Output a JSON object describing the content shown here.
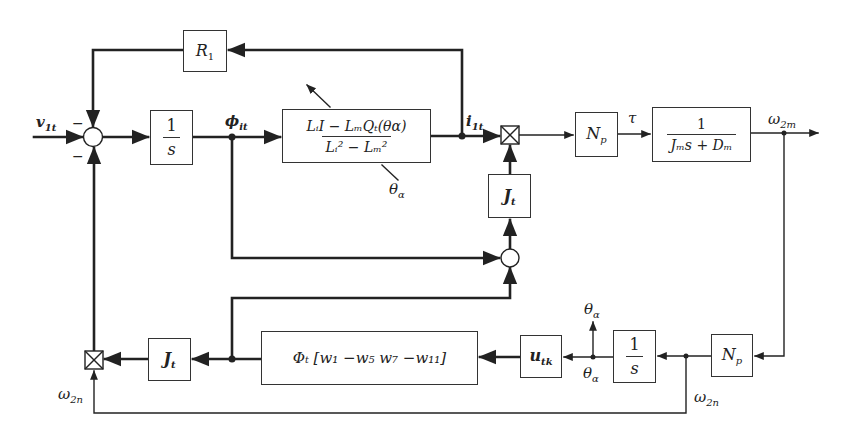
{
  "diagram": {
    "type": "control-block-diagram",
    "input": {
      "symbol": "v",
      "subscript": "1t"
    },
    "summing_junction_main": {
      "signs": [
        "-",
        "-"
      ]
    },
    "blocks": {
      "R1": {
        "label": "R",
        "subscript": "1"
      },
      "integrator_top": {
        "numerator": "1",
        "denominator": "s"
      },
      "inductance": {
        "numerator": "LᵢI − LₘQₜ(θα)",
        "denominator": "Lᵢ² − Lₘ²",
        "parameter": "θα"
      },
      "Np_top": {
        "label": "N",
        "subscript": "p"
      },
      "plant": {
        "numerator": "1",
        "denominator": "Jₘs + Dₘ"
      },
      "Jt_right": {
        "label": "J",
        "subscript": "t"
      },
      "Jt_bottom": {
        "label": "J",
        "subscript": "t"
      },
      "phi_weights": {
        "label": "Φₜ [w₁ −w₅   w₇ −w₁₁]"
      },
      "utk": {
        "label": "u",
        "subscript": "tk"
      },
      "integrator_bottom": {
        "numerator": "1",
        "denominator": "s"
      },
      "Np_bottom": {
        "label": "N",
        "subscript": "p"
      }
    },
    "signals": {
      "phi": {
        "symbol": "ϕ",
        "subscript": "it"
      },
      "i1t": {
        "symbol": "i",
        "subscript": "1t"
      },
      "tau": {
        "symbol": "τ"
      },
      "omega2m": {
        "symbol": "ω",
        "subscript": "2m"
      },
      "omega2n_right": {
        "symbol": "ω",
        "subscript": "2n"
      },
      "omega2n_left": {
        "symbol": "ω",
        "subscript": "2n"
      },
      "theta_alpha_param": {
        "symbol": "θ",
        "subscript": "α"
      },
      "theta_alpha_out": {
        "symbol": "θ",
        "subscript": "α"
      },
      "theta_alpha_node": {
        "symbol": "θ",
        "subscript": "α"
      }
    },
    "minus_sign": "−"
  }
}
